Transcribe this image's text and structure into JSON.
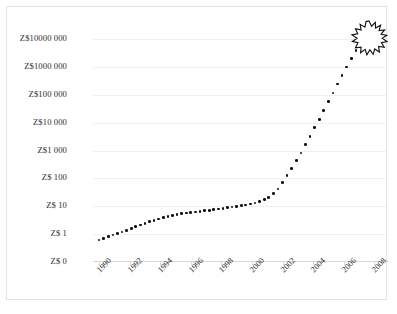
{
  "figure": {
    "caption": "",
    "currency_prefix": "Z$"
  },
  "chart_data": {
    "type": "scatter",
    "title": "",
    "subtitle": "",
    "xlabel": "",
    "ylabel": "",
    "yscale": "log",
    "grid": true,
    "legend": null,
    "annotations": [
      {
        "name": "hyperinflation-explosion",
        "shape": "starburst",
        "x": 2008.6,
        "note": "currency collapse"
      }
    ],
    "ytick_labels": [
      "Z$10000 000",
      "Z$1000 000",
      "Z$100 000",
      "Z$10 000",
      "Z$1 000",
      "Z$ 100",
      "Z$ 10",
      "Z$ 1",
      "Z$ 0"
    ],
    "ytick_values": [
      10000000,
      1000000,
      100000,
      10000,
      1000,
      100,
      10,
      1,
      0
    ],
    "xtick_labels": [
      "1990",
      "1992",
      "1994",
      "1996",
      "1998",
      "2000",
      "2002",
      "2004",
      "2006",
      "2008"
    ],
    "xtick_values": [
      1990,
      1992,
      1994,
      1996,
      1998,
      2000,
      2002,
      2004,
      2006,
      2008
    ],
    "xlim": [
      1989.6,
      2008.9
    ],
    "ylim_log_decades": [
      0,
      7
    ],
    "x": [
      1990.0,
      1990.3,
      1990.6,
      1990.9,
      1991.2,
      1991.5,
      1991.8,
      1992.1,
      1992.4,
      1992.7,
      1993.0,
      1993.3,
      1993.6,
      1993.9,
      1994.2,
      1994.5,
      1994.8,
      1995.1,
      1995.4,
      1995.7,
      1996.0,
      1996.3,
      1996.6,
      1996.9,
      1997.2,
      1997.5,
      1997.8,
      1998.1,
      1998.4,
      1998.7,
      1999.0,
      1999.3,
      1999.6,
      1999.9,
      2000.2,
      2000.5,
      2000.8,
      2001.1,
      2001.4,
      2001.7,
      2002.0,
      2002.3,
      2002.6,
      2002.9,
      2003.2,
      2003.5,
      2003.8,
      2004.1,
      2004.4,
      2004.7,
      2005.0,
      2005.3,
      2005.6,
      2005.9,
      2006.2,
      2006.5,
      2006.8,
      2007.1,
      2007.4,
      2007.7,
      2008.0,
      2008.3
    ],
    "y": [
      0.62,
      0.7,
      0.8,
      0.92,
      1.05,
      1.2,
      1.38,
      1.6,
      1.85,
      2.15,
      2.45,
      2.8,
      3.15,
      3.5,
      3.85,
      4.2,
      4.6,
      5.0,
      5.35,
      5.65,
      5.95,
      6.25,
      6.55,
      6.85,
      7.2,
      7.6,
      8.0,
      8.45,
      8.9,
      9.4,
      9.9,
      10.5,
      11.2,
      12.0,
      13.0,
      14.5,
      17.0,
      21.0,
      28.0,
      42.0,
      70.0,
      125,
      230,
      430,
      820,
      1600,
      3200,
      6500,
      13000,
      27000,
      56000,
      115000,
      240000,
      500000,
      1000000,
      2000000,
      3900000,
      7400000,
      13500000,
      24000000,
      42000000,
      72000000
    ],
    "value_units": "price index (Z$)"
  }
}
